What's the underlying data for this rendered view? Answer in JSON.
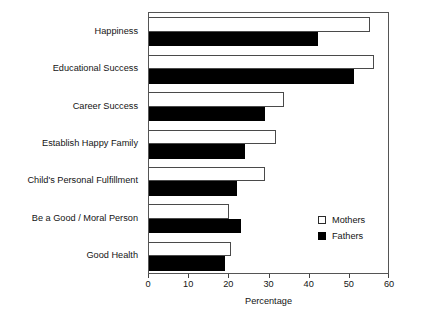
{
  "chart_data": {
    "type": "bar",
    "orientation": "horizontal",
    "title": "",
    "xlabel": "Percentage",
    "ylabel": "",
    "xlim": [
      0,
      60
    ],
    "xticks": [
      0,
      10,
      20,
      30,
      40,
      50,
      60
    ],
    "grid": false,
    "legend_position": "inside-bottom-right",
    "categories": [
      "Happiness",
      "Educational Success",
      "Career Success",
      "Establish Happy Family",
      "Child's Personal Fulfillment",
      "Be a Good / Moral Person",
      "Good Health"
    ],
    "series": [
      {
        "name": "Mothers",
        "color": "#ffffff",
        "edge_color": "#4a4a4a",
        "values": [
          55,
          56,
          33.5,
          31.5,
          29,
          19.8,
          20.5
        ]
      },
      {
        "name": "Fathers",
        "color": "#000000",
        "edge_color": "#000000",
        "values": [
          42,
          51,
          29,
          24,
          22,
          23,
          19
        ]
      }
    ]
  },
  "legend": {
    "items": [
      {
        "label": "Mothers",
        "swatch": "open-square-icon"
      },
      {
        "label": "Fathers",
        "swatch": "filled-square-icon"
      }
    ]
  },
  "axis": {
    "x_title": "Percentage",
    "tick_labels": [
      "0",
      "10",
      "20",
      "30",
      "40",
      "50",
      "60"
    ]
  }
}
